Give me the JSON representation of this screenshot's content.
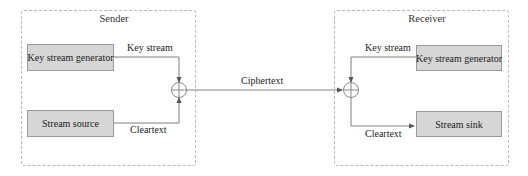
{
  "diagram": {
    "type": "stream-cipher-block-diagram",
    "colors": {
      "block_fill": "#d6d6d6",
      "block_border": "#9a9a9a",
      "line": "#808080",
      "frame_border": "#b8b8b8",
      "text": "#222222"
    },
    "sender": {
      "title": "Sender",
      "key_generator_label": "Key stream generator",
      "source_label": "Stream source",
      "key_stream_label": "Key stream",
      "cleartext_label": "Cleartext",
      "xor_icon": "xor-circle-plus"
    },
    "channel": {
      "label": "Ciphertext"
    },
    "receiver": {
      "title": "Receiver",
      "key_generator_label": "Key stream generator",
      "sink_label": "Stream sink",
      "key_stream_label": "Key stream",
      "cleartext_label": "Cleartext",
      "xor_icon": "xor-circle-plus"
    }
  }
}
